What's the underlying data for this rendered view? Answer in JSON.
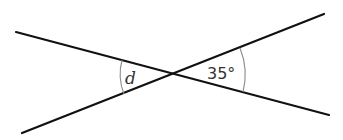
{
  "diagram": {
    "type": "intersecting-lines",
    "intersection": {
      "x": 174,
      "y": 74
    },
    "lines": [
      {
        "id": "line-a",
        "from": {
          "x": 16,
          "y": 32
        },
        "to": {
          "x": 329,
          "y": 115
        }
      },
      {
        "id": "line-b",
        "from": {
          "x": 22,
          "y": 133
        },
        "to": {
          "x": 324,
          "y": 14
        }
      }
    ],
    "angles": [
      {
        "id": "angle-left",
        "label": "d",
        "side": "left",
        "arc_radius": 54
      },
      {
        "id": "angle-right",
        "label": "35°",
        "side": "right",
        "arc_radius": 71,
        "value_degrees": 35
      }
    ],
    "colors": {
      "line": "#111111",
      "arc": "#8a8a8a",
      "text": "#333333",
      "background": "#ffffff"
    }
  }
}
